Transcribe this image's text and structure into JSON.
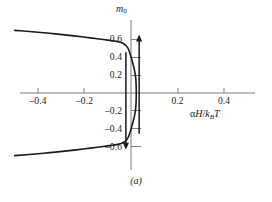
{
  "figure": {
    "caption": "(a)",
    "axis_color": "#7d7d7d",
    "curve_color": "#1a1a1a",
    "arrow_color": "#1a1a1a",
    "background": "#ffffff"
  },
  "chart_data": {
    "type": "line",
    "title": "",
    "subtitle": "",
    "caption": "(a)",
    "xlabel": "αH/k_BT",
    "ylabel": "m_0",
    "xlabel_parts": {
      "alpha": "α",
      "field": "H",
      "slash": "/",
      "boltzmann": "k",
      "boltzmann_sub": "B",
      "temperature": "T"
    },
    "ylabel_parts": {
      "symbol": "m",
      "subscript": "0"
    },
    "grid": false,
    "legend": null,
    "xlim": [
      -0.5,
      0.5
    ],
    "ylim": [
      -0.78,
      0.78
    ],
    "xticks": [
      -0.4,
      -0.2,
      0.2,
      0.4
    ],
    "xticklabels": [
      "–0.4",
      "–0.2",
      "0.2",
      "0.4"
    ],
    "yticks": [
      -0.6,
      -0.4,
      -0.2,
      0.2,
      0.4,
      0.6
    ],
    "yticklabels": [
      "–0.6",
      "–0.4",
      "–0.2",
      "0.2",
      "0.4",
      "0.6"
    ],
    "series": [
      {
        "name": "mean-field magnetization (S-shaped isotherm)",
        "comment": "Multivalued S curve: m as the ordinate, reduced field as abscissa",
        "points": [
          [
            -0.5,
            -0.7
          ],
          [
            -0.45,
            -0.69
          ],
          [
            -0.4,
            -0.679
          ],
          [
            -0.35,
            -0.667
          ],
          [
            -0.3,
            -0.654
          ],
          [
            -0.25,
            -0.64
          ],
          [
            -0.22,
            -0.631
          ],
          [
            -0.19,
            -0.621
          ],
          [
            -0.16,
            -0.611
          ],
          [
            -0.13,
            -0.601
          ],
          [
            -0.11,
            -0.594
          ],
          [
            -0.09,
            -0.587
          ],
          [
            -0.07,
            -0.58
          ],
          [
            -0.055,
            -0.573
          ],
          [
            -0.045,
            -0.566
          ],
          [
            -0.035,
            -0.556
          ],
          [
            -0.025,
            -0.54
          ],
          [
            -0.018,
            -0.522
          ],
          [
            -0.012,
            -0.498
          ],
          [
            -0.008,
            -0.47
          ],
          [
            -0.004,
            -0.44
          ],
          [
            0.0,
            -0.405
          ],
          [
            0.004,
            -0.368
          ],
          [
            0.008,
            -0.33
          ],
          [
            0.012,
            -0.29
          ],
          [
            0.016,
            -0.245
          ],
          [
            0.019,
            -0.2
          ],
          [
            0.021,
            -0.15
          ],
          [
            0.022,
            -0.1
          ],
          [
            0.0225,
            -0.05
          ],
          [
            0.0225,
            0.0
          ],
          [
            0.0225,
            0.05
          ],
          [
            0.022,
            0.1
          ],
          [
            0.021,
            0.15
          ],
          [
            0.019,
            0.2
          ],
          [
            0.016,
            0.245
          ],
          [
            0.012,
            0.29
          ],
          [
            0.008,
            0.33
          ],
          [
            0.004,
            0.368
          ],
          [
            0.0,
            0.405
          ],
          [
            -0.004,
            0.44
          ],
          [
            -0.008,
            0.47
          ],
          [
            -0.012,
            0.498
          ],
          [
            -0.018,
            0.522
          ],
          [
            -0.025,
            0.54
          ],
          [
            -0.035,
            0.556
          ],
          [
            -0.045,
            0.566
          ],
          [
            -0.055,
            0.573
          ],
          [
            -0.07,
            0.58
          ],
          [
            -0.09,
            0.587
          ],
          [
            -0.11,
            0.594
          ],
          [
            -0.13,
            0.601
          ],
          [
            -0.16,
            0.611
          ],
          [
            -0.19,
            0.621
          ],
          [
            -0.22,
            0.631
          ],
          [
            -0.25,
            0.64
          ],
          [
            -0.3,
            0.654
          ],
          [
            -0.35,
            0.667
          ],
          [
            -0.4,
            0.679
          ],
          [
            -0.45,
            0.69
          ],
          [
            -0.5,
            0.7
          ]
        ]
      }
    ],
    "annotations": [
      {
        "name": "down-arrow",
        "type": "arrow",
        "direction": "down",
        "x": -0.022,
        "y_start": 0.455,
        "y_end": -0.635
      },
      {
        "name": "up-arrow",
        "type": "arrow",
        "direction": "up",
        "x": 0.035,
        "y_start": -0.455,
        "y_end": 0.655
      }
    ]
  }
}
